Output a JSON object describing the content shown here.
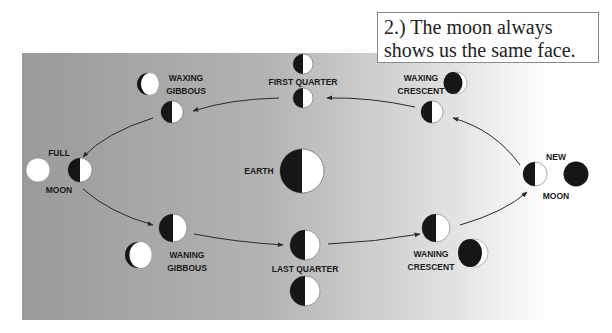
{
  "callout": {
    "line1": "2.) The moon always",
    "line2": "shows us the same face."
  },
  "colors": {
    "panel_gradient_start": "#9c9c9c",
    "panel_gradient_mid": "#b8b8b8",
    "panel_gradient_end": "#ffffff",
    "moon_dark": "#161616",
    "moon_light": "#ffffff",
    "arrow": "#2a2a2a"
  },
  "center": {
    "label": "EARTH"
  },
  "phases": [
    {
      "id": "full-moon",
      "label_lines": [
        "FULL",
        "MOON"
      ],
      "view": "full"
    },
    {
      "id": "waxing-gibbous",
      "label_lines": [
        "WAXING",
        "GIBBOUS"
      ],
      "view": "gibbous-waxing"
    },
    {
      "id": "first-quarter",
      "label_lines": [
        "FIRST QUARTER"
      ],
      "view": "half-right-lit"
    },
    {
      "id": "waxing-crescent",
      "label_lines": [
        "WAXING",
        "CRESCENT"
      ],
      "view": "crescent-waxing"
    },
    {
      "id": "new-moon",
      "label_lines": [
        "NEW",
        "MOON"
      ],
      "view": "new"
    },
    {
      "id": "waning-crescent",
      "label_lines": [
        "WANING",
        "CRESCENT"
      ],
      "view": "crescent-waning"
    },
    {
      "id": "last-quarter",
      "label_lines": [
        "LAST QUARTER"
      ],
      "view": "half-right-lit"
    },
    {
      "id": "waning-gibbous",
      "label_lines": [
        "WANING",
        "GIBBOUS"
      ],
      "view": "gibbous-waning"
    }
  ],
  "labels": {
    "full_1": "FULL",
    "full_2": "MOON",
    "wax_gib_1": "WAXING",
    "wax_gib_2": "GIBBOUS",
    "first_q": "FIRST QUARTER",
    "wax_cres_1": "WAXING",
    "wax_cres_2": "CRESCENT",
    "new_1": "NEW",
    "new_2": "MOON",
    "wan_cres_1": "WANING",
    "wan_cres_2": "CRESCENT",
    "last_q": "LAST QUARTER",
    "wan_gib_1": "WANING",
    "wan_gib_2": "GIBBOUS",
    "earth": "EARTH"
  }
}
